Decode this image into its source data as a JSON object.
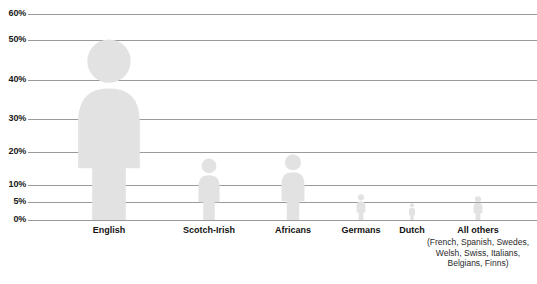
{
  "chart_data": {
    "type": "bar",
    "title": "",
    "subtitle": "",
    "xlabel": "",
    "ylabel": "",
    "grid": true,
    "legend": "none",
    "pictogram": true,
    "ylim": [
      0,
      60
    ],
    "ytick_labels": [
      "0%",
      "5%",
      "10%",
      "20%",
      "30%",
      "40%",
      "50%",
      "60%"
    ],
    "ytick_values": [
      0,
      5,
      10,
      20,
      30,
      40,
      50,
      60
    ],
    "categories": [
      "English",
      "Scotch-Irish",
      "Africans",
      "Germans",
      "Dutch",
      "All others"
    ],
    "values": [
      50,
      15,
      19,
      7,
      3,
      6
    ],
    "units": "percent",
    "series": [
      {
        "name": "Share of population",
        "values": [
          50,
          15,
          19,
          7,
          3,
          6
        ]
      }
    ],
    "annotations": [
      {
        "attached_to": "All others",
        "text": "(French, Spanish, Swedes, Welsh, Swiss, Italians, Belgians, Finns)"
      }
    ],
    "colors": {
      "figure_fill": "#e2e2e2",
      "gridline": "#9a9a9a",
      "label_text": "#111111",
      "background": "#ffffff"
    }
  },
  "axis": {
    "ticks": [
      {
        "label": "60%",
        "value": 60,
        "y": 14
      },
      {
        "label": "50%",
        "value": 50,
        "y": 40
      },
      {
        "label": "40%",
        "value": 40,
        "y": 80
      },
      {
        "label": "30%",
        "value": 30,
        "y": 119
      },
      {
        "label": "20%",
        "value": 20,
        "y": 152
      },
      {
        "label": "10%",
        "value": 10,
        "y": 185
      },
      {
        "label": "5%",
        "value": 5,
        "y": 202
      },
      {
        "label": "0%",
        "value": 0,
        "y": 220
      }
    ]
  },
  "figures": [
    {
      "name": "english",
      "label": "English",
      "sublabel": "",
      "value": 50,
      "center_x": 109,
      "height": 182,
      "width": 70
    },
    {
      "name": "scotch-irish",
      "label": "Scotch-Irish",
      "sublabel": "",
      "value": 15,
      "center_x": 209,
      "height": 62,
      "width": 24
    },
    {
      "name": "africans",
      "label": "Africans",
      "sublabel": "",
      "value": 19,
      "center_x": 293,
      "height": 66,
      "width": 26
    },
    {
      "name": "germans",
      "label": "Germans",
      "sublabel": "",
      "value": 7,
      "center_x": 361,
      "height": 26,
      "width": 10
    },
    {
      "name": "dutch",
      "label": "Dutch",
      "sublabel": "",
      "value": 3,
      "center_x": 412,
      "height": 17,
      "width": 7
    },
    {
      "name": "all-others",
      "label": "All others",
      "sublabel": "(French, Spanish, Swedes, Welsh, Swiss, Italians, Belgians, Finns)",
      "value": 6,
      "center_x": 478,
      "height": 24,
      "width": 10
    }
  ]
}
